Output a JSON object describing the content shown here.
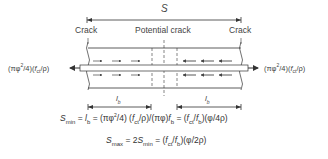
{
  "diagram": {
    "spacing_label": "S",
    "crack_left_label": "Crack",
    "potential_crack_label": "Potential crack",
    "crack_right_label": "Crack",
    "force_left_label": "(πφ²/4)(f_ct/ρ)",
    "force_right_label": "(πφ²/4)(f_ct/ρ)",
    "bond_length_left_label": "l_b",
    "bond_length_right_label": "l_b",
    "colors": {
      "line": "#333333",
      "text": "#444444",
      "background": "#ffffff"
    }
  },
  "equations": {
    "smin": "S_min = l_b = (πφ²/4) (f_ct/ρ)/(πφ)f_b = (f_ct/f_b)(φ/4ρ)",
    "smax": "S_max = 2S_min = (f_ct/f_b)(φ/2ρ)"
  }
}
